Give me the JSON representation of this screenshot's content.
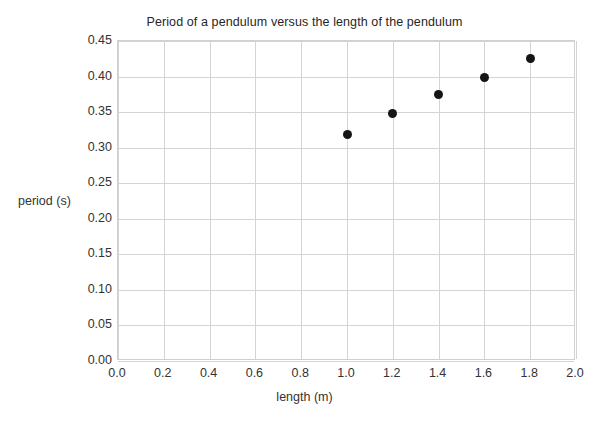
{
  "chart_data": {
    "type": "scatter",
    "title": "Period of a pendulum versus the length of the pendulum",
    "xlabel": "length (m)",
    "ylabel": "period (s)",
    "xlim": [
      0.0,
      2.0
    ],
    "ylim": [
      0.0,
      0.45
    ],
    "grid": true,
    "legend": null,
    "xticks": [
      "0.0",
      "0.2",
      "0.4",
      "0.6",
      "0.8",
      "1.0",
      "1.2",
      "1.4",
      "1.6",
      "1.8",
      "2.0"
    ],
    "xtick_values": [
      0.0,
      0.2,
      0.4,
      0.6,
      0.8,
      1.0,
      1.2,
      1.4,
      1.6,
      1.8,
      2.0
    ],
    "yticks": [
      "0.00",
      "0.05",
      "0.10",
      "0.15",
      "0.20",
      "0.25",
      "0.30",
      "0.35",
      "0.40",
      "0.45"
    ],
    "ytick_values": [
      0.0,
      0.05,
      0.1,
      0.15,
      0.2,
      0.25,
      0.3,
      0.35,
      0.4,
      0.45
    ],
    "series": [
      {
        "name": "pendulum period",
        "marker": "filled-circle",
        "color": "#151515",
        "x": [
          1.0,
          1.2,
          1.4,
          1.6,
          1.8
        ],
        "y": [
          0.318,
          0.348,
          0.375,
          0.399,
          0.425
        ]
      }
    ]
  },
  "colors": {
    "marker": "#151515",
    "grid": "#d4d4d4",
    "axis_text": "#333333",
    "title_text": "#262626",
    "background": "#ffffff"
  }
}
